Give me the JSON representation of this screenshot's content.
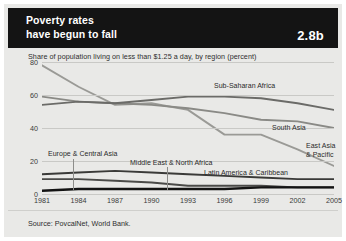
{
  "header": {
    "title_line1": "Poverty rates",
    "title_line2": "have begun to fall",
    "number": "2.8b",
    "bg_color": "#141414",
    "text_color": "#ffffff"
  },
  "subtitle": "Share of population living on less than $1.25 a day, by region (percent)",
  "source": "Source: PovcalNet, World Bank.",
  "chart_data": {
    "type": "line",
    "title": "Poverty rates have begun to fall",
    "subtitle": "Share of population living on less than $1.25 a day, by region (percent)",
    "xlabel": "",
    "ylabel": "",
    "x": [
      1981,
      1984,
      1987,
      1990,
      1993,
      1996,
      1999,
      2002,
      2005
    ],
    "xticks": [
      "1981",
      "1984",
      "1987",
      "1990",
      "1993",
      "1996",
      "1999",
      "2002",
      "2005"
    ],
    "yticks": [
      "0",
      "20",
      "40",
      "60",
      "80"
    ],
    "ytick_values": [
      0,
      20,
      40,
      60,
      80
    ],
    "ylim": [
      0,
      80
    ],
    "xlim": [
      1981,
      2005
    ],
    "grid": true,
    "legend_position": "inline-labels",
    "series": [
      {
        "name": "East Asia & Pacific",
        "color": "#9a9a96",
        "width": 1.9,
        "values": [
          78,
          65,
          54,
          55,
          51,
          36,
          36,
          27,
          17
        ],
        "label_x": 302,
        "label_y": 138,
        "label_lines": [
          "East Asia",
          "& Pacific"
        ]
      },
      {
        "name": "South Asia",
        "color": "#8a8a86",
        "width": 1.9,
        "values": [
          59,
          56,
          55,
          54,
          52,
          49,
          45,
          44,
          40
        ],
        "label_x": 268,
        "label_y": 120,
        "label_lines": [
          "South Asia"
        ]
      },
      {
        "name": "Sub-Saharan Africa",
        "color": "#6b6b68",
        "width": 1.9,
        "values": [
          54,
          56,
          55,
          57,
          59,
          59,
          58,
          55,
          51
        ],
        "label_x": 210,
        "label_y": 78,
        "label_lines": [
          "Sub-Saharan Africa"
        ]
      },
      {
        "name": "Europe & Central Asia",
        "color": "#4a4a48",
        "width": 1.9,
        "values": [
          9,
          9,
          8,
          7,
          5,
          5,
          5,
          4,
          4
        ],
        "label_x": 44,
        "label_y": 146,
        "label_lines": [
          "Europe & Central Asia"
        ],
        "leader_x": 69,
        "leader_y1": 155,
        "leader_y2": 186
      },
      {
        "name": "Middle East & North Africa",
        "color": "#3a3a38",
        "width": 1.9,
        "values": [
          12,
          13,
          14,
          13,
          12,
          11,
          10,
          9,
          9
        ],
        "label_x": 126,
        "label_y": 155,
        "label_lines": [
          "Middle East & North Africa"
        ],
        "leader_x": 163,
        "leader_y1": 163,
        "leader_y2": 186
      },
      {
        "name": "Latin America & Caribbean",
        "color": "#131313",
        "width": 2.4,
        "values": [
          2,
          3,
          3,
          3,
          3,
          3,
          4,
          4,
          4
        ],
        "label_x": 200,
        "label_y": 165,
        "label_lines": [
          "Latin America & Caribbean"
        ]
      }
    ]
  }
}
